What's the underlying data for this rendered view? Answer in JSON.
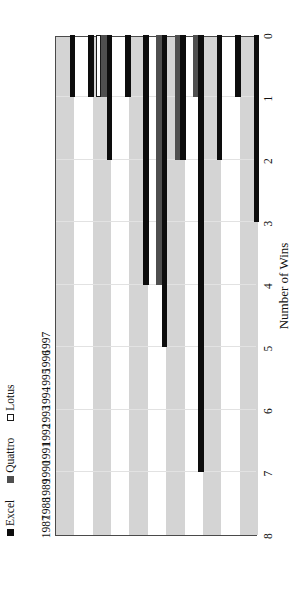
{
  "chart_data": {
    "type": "bar",
    "orientation": "horizontal-rotated",
    "title": "",
    "xlabel": "Number of Wins",
    "ylabel": "",
    "categories": [
      "1987",
      "1988",
      "1989",
      "1990",
      "1991",
      "1992",
      "1993",
      "1994",
      "1995",
      "1996",
      "1997"
    ],
    "value_ticks": [
      "8",
      "7",
      "6",
      "5",
      "4",
      "3",
      "2",
      "1",
      "0"
    ],
    "value_tick_numbers": [
      8,
      7,
      6,
      5,
      4,
      3,
      2,
      1,
      0
    ],
    "xlim": [
      0,
      8
    ],
    "value_axis_reversed": true,
    "grid": true,
    "legend_position": "top-left",
    "series": [
      {
        "name": "Excel",
        "color": "#0d0d0d",
        "values": [
          1,
          1,
          2,
          1,
          4,
          5,
          2,
          7,
          2,
          1,
          3
        ]
      },
      {
        "name": "Quattro",
        "color": "#4f4f4f",
        "values": [
          0,
          0,
          1,
          0,
          0,
          4,
          2,
          1,
          0,
          0,
          0
        ]
      },
      {
        "name": "Lotus",
        "color": "#ffffff",
        "values": [
          0,
          0,
          1,
          0,
          0,
          0,
          0,
          0,
          0,
          0,
          0
        ]
      }
    ]
  },
  "legend": {
    "items": [
      {
        "label": "Excel",
        "swatch": "excel-swatch-icon"
      },
      {
        "label": "Quattro",
        "swatch": "quattro-swatch-icon"
      },
      {
        "label": "Lotus",
        "swatch": "lotus-swatch-icon"
      }
    ]
  },
  "axes": {
    "value_axis_title": "Number of Wins"
  }
}
